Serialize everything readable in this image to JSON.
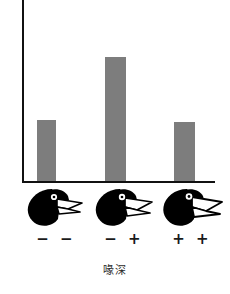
{
  "chart_data": {
    "type": "bar",
    "title": "",
    "subtitle": "",
    "xlabel": "喙深",
    "ylabel": "",
    "categories": [
      "− −",
      "− +",
      "+ +"
    ],
    "values": [
      61,
      124,
      59
    ],
    "ylim": [
      0,
      181
    ],
    "grid": false,
    "legend": null,
    "bar_color": "#7d7d7d",
    "axis_color": "#111111",
    "annotations": [
      {
        "category": "− −",
        "icon": "finch-head-small-beak"
      },
      {
        "category": "− +",
        "icon": "finch-head-medium-beak"
      },
      {
        "category": "+ +",
        "icon": "finch-head-large-beak"
      }
    ]
  },
  "figure": {
    "x_axis_title": "喙深",
    "y_axis_title": "",
    "bars": [
      {
        "id": "bar-minus-minus",
        "label": "− −",
        "value": 61,
        "left_px": 37,
        "width_px": 19,
        "height_px": 61
      },
      {
        "id": "bar-minus-plus",
        "label": "− +",
        "value": 124,
        "left_px": 105,
        "width_px": 21,
        "height_px": 124
      },
      {
        "id": "bar-plus-plus",
        "label": "+ +",
        "value": 59,
        "left_px": 174,
        "width_px": 21,
        "height_px": 59
      }
    ],
    "birds": [
      {
        "id": "finch-small",
        "icon_name": "finch-head-icon",
        "beak": "small",
        "left_px": 2
      },
      {
        "id": "finch-medium",
        "icon_name": "finch-head-icon",
        "beak": "medium",
        "left_px": 70
      },
      {
        "id": "finch-large",
        "icon_name": "finch-head-icon",
        "beak": "large",
        "left_px": 138
      }
    ],
    "genotypes": [
      {
        "id": "genotype-minus-minus",
        "label": "− −",
        "left_px": 2
      },
      {
        "id": "genotype-minus-plus",
        "label": "− +",
        "left_px": 70
      },
      {
        "id": "genotype-plus-plus",
        "label": "+ +",
        "left_px": 138
      }
    ]
  }
}
